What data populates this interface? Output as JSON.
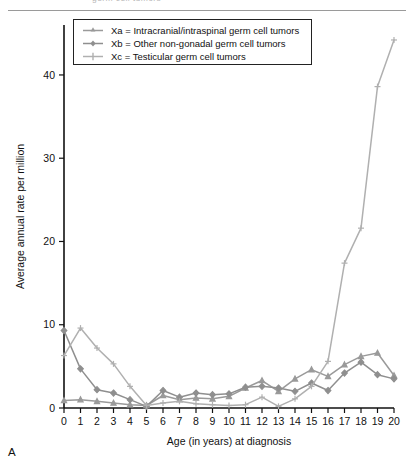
{
  "page": {
    "header_text": "germ cell tumors",
    "panel_letter": "A"
  },
  "legend": {
    "items": [
      {
        "key": "Xa",
        "label": "Xa = Intracranial/intraspinal germ cell tumors",
        "color": "#9a9a9a",
        "marker": "triangle"
      },
      {
        "key": "Xb",
        "label": "Xb = Other non-gonadal germ cell tumors",
        "color": "#8f8f8f",
        "marker": "diamond"
      },
      {
        "key": "Xc",
        "label": "Xc = Testicular germ cell tumors",
        "color": "#b0b0b0",
        "marker": "plus"
      }
    ]
  },
  "chart_data": {
    "type": "line",
    "title": "",
    "xlabel": "Age (in years) at diagnosis",
    "ylabel": "Average annual rate per million",
    "xlim": [
      0,
      20
    ],
    "ylim": [
      0,
      46
    ],
    "xticks": [
      0,
      1,
      2,
      3,
      4,
      5,
      6,
      7,
      8,
      9,
      10,
      11,
      12,
      13,
      14,
      15,
      16,
      17,
      18,
      19,
      20
    ],
    "yticks": [
      0,
      10,
      20,
      30,
      40
    ],
    "ytick_labels": [
      "0",
      "10",
      "20",
      "30",
      "40"
    ],
    "grid": false,
    "legend_position": "top-left",
    "x": [
      0,
      1,
      2,
      3,
      4,
      5,
      6,
      7,
      8,
      9,
      10,
      11,
      12,
      13,
      14,
      15,
      16,
      17,
      18,
      19,
      20
    ],
    "series": [
      {
        "name": "Xa = Intracranial/intraspinal germ cell tumors",
        "key": "Xa",
        "color": "#9a9a9a",
        "marker": "triangle",
        "values": [
          0.9,
          1.0,
          0.8,
          0.6,
          0.4,
          0.3,
          1.5,
          1.0,
          1.2,
          1.1,
          1.4,
          2.4,
          3.3,
          2.0,
          3.5,
          4.6,
          3.8,
          5.2,
          6.2,
          6.6,
          3.9
        ]
      },
      {
        "name": "Xb = Other non-gonadal germ cell tumors",
        "key": "Xb",
        "color": "#8f8f8f",
        "marker": "diamond",
        "values": [
          9.3,
          4.7,
          2.2,
          1.8,
          1.0,
          0.2,
          2.1,
          1.3,
          1.8,
          1.6,
          1.7,
          2.5,
          2.6,
          2.4,
          2.0,
          3.0,
          2.1,
          4.2,
          5.5,
          4.0,
          3.5
        ]
      },
      {
        "name": "Xc = Testicular germ cell tumors",
        "key": "Xc",
        "color": "#b0b0b0",
        "marker": "plus",
        "values": [
          6.3,
          9.6,
          7.2,
          5.3,
          2.6,
          0.3,
          0.6,
          0.8,
          0.5,
          0.4,
          0.3,
          0.4,
          1.3,
          0.2,
          1.1,
          2.6,
          5.6,
          17.4,
          21.6,
          38.6,
          44.2
        ]
      }
    ]
  }
}
